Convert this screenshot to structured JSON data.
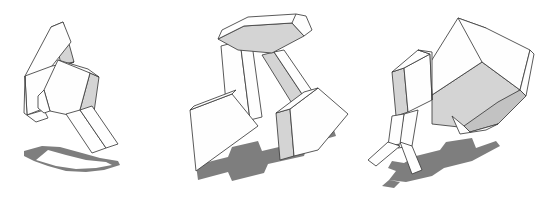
{
  "canvas": {
    "width": 539,
    "height": 200,
    "background": "#ffffff",
    "title": "Three articulated block figures line drawing"
  },
  "palette": {
    "outline": "#3c3c3c",
    "face_light": "#fefefe",
    "face_mid": "#d4d4d4",
    "face_dark": "#c2c2c2",
    "shadow": "#7e7e7e",
    "background": "#ffffff"
  },
  "figures": [
    {
      "id": "figure-left",
      "label": "Left figure",
      "description": "Two flat slab blocks leaning against each other with a narrow vertical bar below, casting a swept shadow to the lower left",
      "parts": [
        {
          "name": "upper-slab",
          "shading": "light"
        },
        {
          "name": "upper-slab-edge",
          "shading": "mid"
        },
        {
          "name": "main-block",
          "shading": "light"
        },
        {
          "name": "main-block-side",
          "shading": "mid"
        },
        {
          "name": "lower-bar",
          "shading": "light"
        }
      ],
      "shadow": {
        "name": "shadow-left"
      }
    },
    {
      "id": "figure-middle",
      "label": "Middle figure",
      "description": "Inverted-V tripod of two legs topped by a wedge block, with two tilted cube blocks hanging at the ends and a long horizontal shadow",
      "parts": [
        {
          "name": "top-wedge-cap",
          "shading": "light"
        },
        {
          "name": "top-wedge-underside",
          "shading": "mid"
        },
        {
          "name": "left-leg",
          "shading": "light"
        },
        {
          "name": "right-leg",
          "shading": "mid"
        },
        {
          "name": "left-cube",
          "shading": "light"
        },
        {
          "name": "right-cube",
          "shading": "light"
        },
        {
          "name": "right-cube-side",
          "shading": "mid"
        }
      ],
      "shadow": {
        "name": "shadow-middle"
      }
    },
    {
      "id": "figure-right",
      "label": "Right figure",
      "description": "Large open box with a shaded interior floor, a small cube attached at the left, two thin splayed legs below, and an angular shadow beneath",
      "parts": [
        {
          "name": "big-box-top",
          "shading": "light"
        },
        {
          "name": "big-box-right",
          "shading": "light"
        },
        {
          "name": "big-box-floor",
          "shading": "mid"
        },
        {
          "name": "big-box-flap",
          "shading": "dark"
        },
        {
          "name": "small-cube-front",
          "shading": "light"
        },
        {
          "name": "small-cube-side",
          "shading": "mid"
        },
        {
          "name": "leg-left",
          "shading": "light"
        },
        {
          "name": "leg-right",
          "shading": "light"
        }
      ],
      "shadow": {
        "name": "shadow-right"
      }
    }
  ]
}
